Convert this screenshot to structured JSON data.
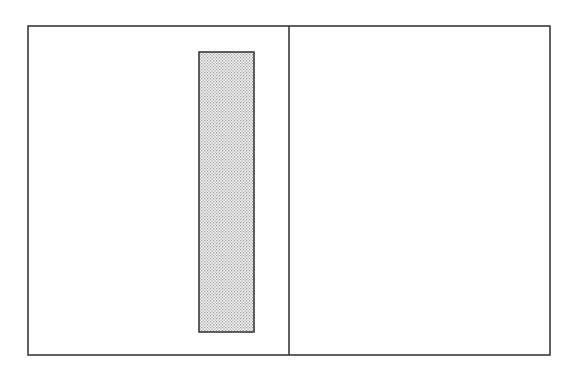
{
  "figure": {
    "title": "",
    "caption": "",
    "background_color": "#ffffff",
    "line_color": "#3a3a3a",
    "hatch_dot_color": "#9a9a9a",
    "hatch_fill_color": "#f2f2f2",
    "canvas": {
      "width": 577,
      "height": 380
    }
  },
  "shapes": {
    "outer_frame": {
      "name": "outer-frame",
      "label": "",
      "x": 28,
      "y": 26,
      "width": 522,
      "height": 329,
      "stroke_width": 1.6,
      "fill": "none"
    },
    "divider": {
      "name": "vertical-divider",
      "label": "",
      "x1": 289,
      "y1": 26,
      "x2": 289,
      "y2": 355,
      "stroke_width": 1.6
    },
    "hatched_rect": {
      "name": "hatched-rectangle",
      "label": "",
      "x": 199,
      "y": 52,
      "width": 55,
      "height": 280,
      "stroke_width": 1.6,
      "fill_pattern": "stipple-dot"
    }
  },
  "panels": [
    {
      "name": "left-panel",
      "label": "",
      "x": 28,
      "y": 26,
      "width": 261,
      "height": 329
    },
    {
      "name": "right-panel",
      "label": "",
      "x": 289,
      "y": 26,
      "width": 261,
      "height": 329
    }
  ],
  "annotations": [],
  "reference_numerals": []
}
